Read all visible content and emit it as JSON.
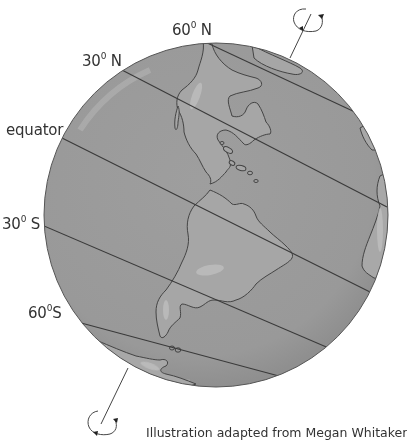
{
  "diagram": {
    "labels": {
      "lat_60n": {
        "num": "60",
        "deg": "0",
        "dir": "N"
      },
      "lat_30n": {
        "num": "30",
        "deg": "0",
        "dir": "N"
      },
      "equator": "equator",
      "lat_30s": {
        "num": "30",
        "deg": "0",
        "dir": "S"
      },
      "lat_60s": {
        "num": "60",
        "deg": "0",
        "dir": "S"
      }
    },
    "credit": "Illustration adapted from Megan Whitaker",
    "colors": {
      "ocean": "#9a9a9a",
      "land": "#a8a8a8",
      "highlight": "#c4c4c4",
      "outline": "#4a4a4a",
      "background": "#ffffff"
    }
  }
}
